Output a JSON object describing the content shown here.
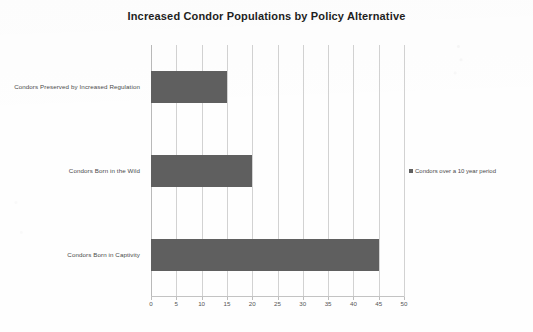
{
  "chart_data": {
    "type": "bar",
    "orientation": "horizontal",
    "title": "Increased Condor Populations by Policy Alternative",
    "xlabel": "",
    "ylabel": "",
    "categories": [
      "Condors Preserved by Increased Regulation",
      "Condors Born in the Wild",
      "Condors Born in Captivity"
    ],
    "values": [
      15,
      20,
      45
    ],
    "series": [
      {
        "name": "Condors over a 10 year period",
        "values": [
          15,
          20,
          45
        ]
      }
    ],
    "xlim": [
      0,
      50
    ],
    "xticks": [
      0,
      5,
      10,
      15,
      20,
      25,
      30,
      35,
      40,
      45,
      50
    ],
    "grid": true,
    "legend_position": "right",
    "bar_color": "#5f5f5f",
    "gridline_color": "#d2d2d2",
    "title_color": "#1f1f1f"
  },
  "legend": {
    "entries": [
      {
        "label": "Condors over a 10 year period",
        "color": "#5f5f5f"
      }
    ]
  }
}
